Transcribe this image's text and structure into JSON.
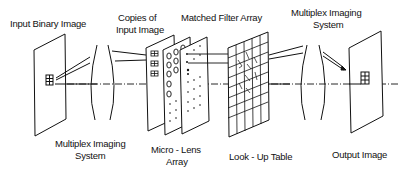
{
  "diagram": {
    "labels": {
      "input_binary_image": "Input Binary Image",
      "copies_of_input_image_1": "Copies of",
      "copies_of_input_image_2": "Input Image",
      "matched_filter_array": "Matched Filter Array",
      "multiplex_imaging_system_top_1": "Multiplex Imaging",
      "multiplex_imaging_system_top_2": "System",
      "multiplex_imaging_system_bottom_1": "Multiplex Imaging",
      "multiplex_imaging_system_bottom_2": "System",
      "micro_lens_array_1": "Micro - Lens",
      "micro_lens_array_2": "Array",
      "look_up_table": "Look - Up Table",
      "output_image": "Output Image"
    },
    "components": [
      {
        "id": "input-plane",
        "type": "image-plane"
      },
      {
        "id": "multiplex-lens-1",
        "type": "lens"
      },
      {
        "id": "copies-plane",
        "type": "image-plane"
      },
      {
        "id": "micro-lens-array",
        "type": "lens-array"
      },
      {
        "id": "matched-filter-array",
        "type": "filter-plane"
      },
      {
        "id": "look-up-table",
        "type": "grid-plane"
      },
      {
        "id": "multiplex-lens-2",
        "type": "lens"
      },
      {
        "id": "output-plane",
        "type": "image-plane"
      }
    ],
    "line_color": "#111111"
  }
}
